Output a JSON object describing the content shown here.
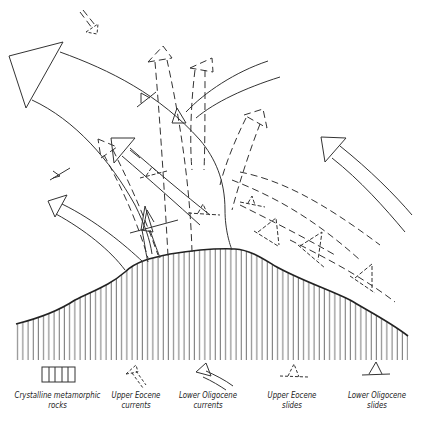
{
  "diagram": {
    "colors": {
      "ink": "#333333",
      "background": "#ffffff"
    }
  },
  "legend": {
    "items": [
      {
        "id": "crystalline",
        "symbol": "vertical-hatch-box",
        "line1": "Crystalline metamorphic",
        "line2": "rocks"
      },
      {
        "id": "upper-eocene-currents",
        "symbol": "dashed-arrow",
        "line1": "Upper Eocene",
        "line2": "currents"
      },
      {
        "id": "lower-oligocene-currents",
        "symbol": "solid-arrow",
        "line1": "Lower Oligocene",
        "line2": "currents"
      },
      {
        "id": "upper-eocene-slides",
        "symbol": "dashed-triangle-on-line",
        "line1": "Upper Eocene",
        "line2": "slides"
      },
      {
        "id": "lower-oligocene-slides",
        "symbol": "solid-triangle-on-line",
        "line1": "Lower Oligocene",
        "line2": "slides"
      }
    ]
  }
}
